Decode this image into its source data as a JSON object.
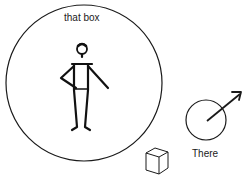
{
  "diagram": {
    "big_circle_label": "that box",
    "small_circle_label": "There",
    "elements": [
      "person-figure",
      "big-circle",
      "box-cube",
      "direction-circle-arrow"
    ],
    "colors": {
      "stroke": "#1a1a1a",
      "background": "#ffffff"
    }
  }
}
